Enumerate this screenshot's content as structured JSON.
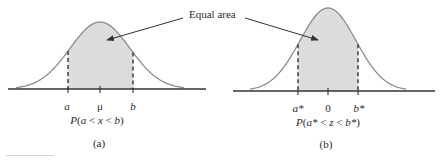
{
  "annotation": {
    "text": "Equal area"
  },
  "panels": [
    {
      "id": "a",
      "caption": "(a)",
      "ticks": {
        "left": "a",
        "center": "μ",
        "right": "b"
      },
      "formula": {
        "prefix": "P(",
        "var1": "a",
        "lt1": " < ",
        "var2": "x",
        "lt2": " < ",
        "var3": "b",
        "suffix": ")"
      }
    },
    {
      "id": "b",
      "caption": "(b)",
      "ticks": {
        "left": "a*",
        "center": "0",
        "right": "b*"
      },
      "formula": {
        "prefix": "P(",
        "var1": "a*",
        "lt1": " < ",
        "var2": "z",
        "lt2": " < ",
        "var3": "b*",
        "suffix": ")"
      }
    }
  ],
  "colors": {
    "curve": "#8c8c8c",
    "shade": "#dcdcdc",
    "axis": "#333333",
    "dash": "#222222",
    "text": "#2a2a2a"
  }
}
